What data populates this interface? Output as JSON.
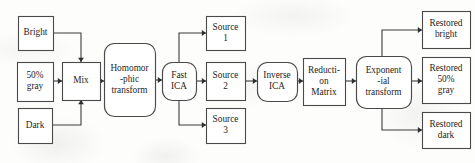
{
  "diagram": {
    "type": "flowchart",
    "colors": {
      "background": "#fdfdfc",
      "node_fill": "#ffffff",
      "node_stroke": "#4a4a4a",
      "edge_stroke": "#3c3c3c",
      "text": "#1d1d1d"
    },
    "nodes": [
      {
        "id": "bright",
        "label": "Bright",
        "lines": [
          "Bright"
        ],
        "shape": "rect",
        "x": 18,
        "y": 16,
        "w": 35,
        "h": 34
      },
      {
        "id": "gray50",
        "label": "50% gray",
        "lines": [
          "50%",
          "gray"
        ],
        "shape": "rect",
        "x": 17,
        "y": 62,
        "w": 36,
        "h": 39
      },
      {
        "id": "dark",
        "label": "Dark",
        "lines": [
          "Dark"
        ],
        "shape": "rect",
        "x": 18,
        "y": 108,
        "w": 34,
        "h": 35
      },
      {
        "id": "mix",
        "label": "Mix",
        "lines": [
          "Mix"
        ],
        "shape": "rect",
        "x": 62,
        "y": 62,
        "w": 38,
        "h": 38
      },
      {
        "id": "homomorphic",
        "label": "Homomorphic transform",
        "lines": [
          "Homomor",
          "-phic",
          "transform"
        ],
        "shape": "rounded",
        "x": 104,
        "y": 43,
        "w": 51,
        "h": 73
      },
      {
        "id": "fast_ica",
        "label": "Fast ICA",
        "lines": [
          "Fast",
          "ICA"
        ],
        "shape": "rounded",
        "x": 162,
        "y": 62,
        "w": 34,
        "h": 38
      },
      {
        "id": "source1",
        "label": "Source 1",
        "lines": [
          "Source",
          "1"
        ],
        "shape": "rect",
        "x": 206,
        "y": 16,
        "w": 39,
        "h": 34
      },
      {
        "id": "source2",
        "label": "Source 2",
        "lines": [
          "Source",
          "2"
        ],
        "shape": "rect",
        "x": 206,
        "y": 62,
        "w": 39,
        "h": 38
      },
      {
        "id": "source3",
        "label": "Source 3",
        "lines": [
          "Source",
          "3"
        ],
        "shape": "rect",
        "x": 206,
        "y": 108,
        "w": 39,
        "h": 35
      },
      {
        "id": "inverse_ica",
        "label": "Inverse ICA",
        "lines": [
          "Inverse",
          "ICA"
        ],
        "shape": "rounded",
        "x": 257,
        "y": 62,
        "w": 40,
        "h": 39
      },
      {
        "id": "reduction_matrix",
        "label": "Reduction Matrix",
        "lines": [
          "Reducti-",
          "on",
          "Matrix"
        ],
        "shape": "rect",
        "x": 303,
        "y": 58,
        "w": 42,
        "h": 47
      },
      {
        "id": "exponential",
        "label": "Exponential transform",
        "lines": [
          "Exponent",
          "-ial",
          "transform"
        ],
        "shape": "rounded",
        "x": 356,
        "y": 56,
        "w": 55,
        "h": 52
      },
      {
        "id": "restored_bright",
        "label": "Restored bright",
        "lines": [
          "Restored",
          "bright"
        ],
        "shape": "rect",
        "x": 422,
        "y": 11,
        "w": 48,
        "h": 37
      },
      {
        "id": "restored_gray",
        "label": "Restored 50% gray",
        "lines": [
          "Restored",
          "50%",
          "gray"
        ],
        "shape": "rect",
        "x": 422,
        "y": 57,
        "w": 48,
        "h": 46
      },
      {
        "id": "restored_dark",
        "label": "Restored dark",
        "lines": [
          "Restored",
          "dark"
        ],
        "shape": "rect",
        "x": 422,
        "y": 112,
        "w": 48,
        "h": 36
      }
    ],
    "edges": [
      {
        "id": "bright-to-mix",
        "from": "bright",
        "to": "mix",
        "points": [
          [
            53,
            33
          ],
          [
            81,
            33
          ],
          [
            81,
            62
          ]
        ],
        "arrow": "down"
      },
      {
        "id": "gray-to-mix",
        "from": "gray50",
        "to": "mix",
        "points": [
          [
            53,
            81
          ],
          [
            62,
            81
          ]
        ],
        "arrow": "right"
      },
      {
        "id": "dark-to-mix",
        "from": "dark",
        "to": "mix",
        "points": [
          [
            52,
            125
          ],
          [
            81,
            125
          ],
          [
            81,
            100
          ]
        ],
        "arrow": "up"
      },
      {
        "id": "mix-to-homomorphic",
        "from": "mix",
        "to": "homomorphic",
        "points": [
          [
            100,
            81
          ],
          [
            104,
            81
          ]
        ],
        "arrow": "right"
      },
      {
        "id": "homomorphic-to-fastica",
        "from": "homomorphic",
        "to": "fast_ica",
        "points": [
          [
            155,
            80
          ],
          [
            162,
            80
          ]
        ],
        "arrow": "right"
      },
      {
        "id": "fastica-to-source1",
        "from": "fast_ica",
        "to": "source1",
        "points": [
          [
            179,
            62
          ],
          [
            179,
            33
          ],
          [
            206,
            33
          ]
        ],
        "arrow": "right"
      },
      {
        "id": "fastica-to-source2",
        "from": "fast_ica",
        "to": "source2",
        "points": [
          [
            196,
            81
          ],
          [
            206,
            81
          ]
        ],
        "arrow": "right"
      },
      {
        "id": "fastica-to-source3",
        "from": "fast_ica",
        "to": "source3",
        "points": [
          [
            179,
            100
          ],
          [
            179,
            125
          ],
          [
            206,
            125
          ]
        ],
        "arrow": "right"
      },
      {
        "id": "source2-to-inverseica",
        "from": "source2",
        "to": "inverse_ica",
        "points": [
          [
            245,
            81
          ],
          [
            257,
            81
          ]
        ],
        "arrow": "right"
      },
      {
        "id": "inverseica-to-reduction",
        "from": "inverse_ica",
        "to": "reduction_matrix",
        "points": [
          [
            297,
            81
          ],
          [
            303,
            81
          ]
        ],
        "arrow": "right"
      },
      {
        "id": "reduction-to-exponential",
        "from": "reduction_matrix",
        "to": "exponential",
        "points": [
          [
            345,
            81
          ],
          [
            356,
            81
          ]
        ],
        "arrow": "right"
      },
      {
        "id": "exponential-to-restored-bright",
        "from": "exponential",
        "to": "restored_bright",
        "points": [
          [
            382,
            56
          ],
          [
            382,
            30
          ],
          [
            422,
            30
          ]
        ],
        "arrow": "right"
      },
      {
        "id": "exponential-to-restored-gray",
        "from": "exponential",
        "to": "restored_gray",
        "points": [
          [
            411,
            81
          ],
          [
            422,
            81
          ]
        ],
        "arrow": "right"
      },
      {
        "id": "exponential-to-restored-dark",
        "from": "exponential",
        "to": "restored_dark",
        "points": [
          [
            382,
            108
          ],
          [
            382,
            130
          ],
          [
            422,
            130
          ]
        ],
        "arrow": "right"
      }
    ]
  }
}
